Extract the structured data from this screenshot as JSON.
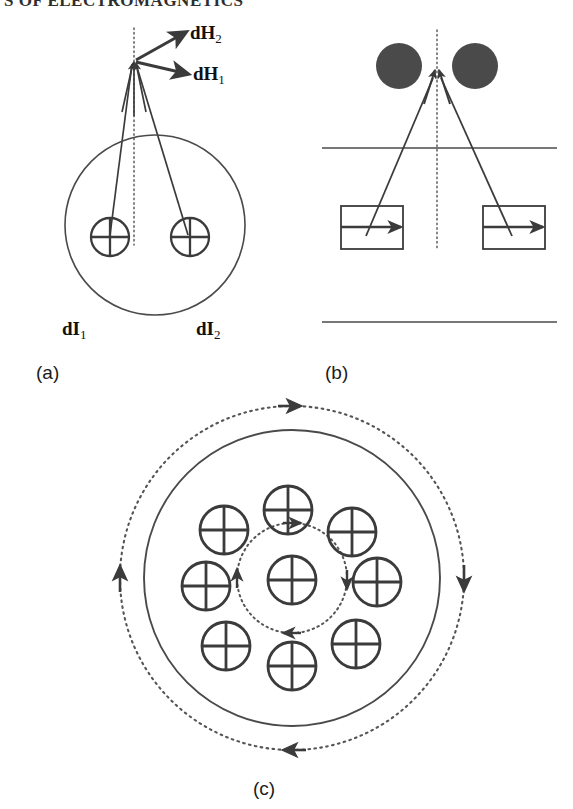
{
  "header": {
    "text": "S OF ELECTROMAGNETICS",
    "clipped": true
  },
  "colors": {
    "stroke": "#3b3b3b",
    "dotted": "#555555",
    "fill_circle": "#4a4a4a",
    "text": "#1a1a1a",
    "background": "#ffffff"
  },
  "panels": [
    {
      "id": "a",
      "caption": "(a)",
      "description": "Two current elements inside a circular conductor cross-section with resultant field vectors at an external point",
      "labels": [
        {
          "name": "field-vector-2",
          "main": "dH",
          "sub": "2"
        },
        {
          "name": "field-vector-1",
          "main": "dH",
          "sub": "1"
        },
        {
          "name": "current-element-1",
          "main": "dI",
          "sub": "1"
        },
        {
          "name": "current-element-2",
          "main": "dI",
          "sub": "2"
        }
      ],
      "symbols": {
        "current_into_page_count": 2,
        "glyph": "oplus"
      },
      "outer_circle": {
        "cx": 155,
        "cy": 225,
        "r": 90
      }
    },
    {
      "id": "b",
      "caption": "(b)",
      "description": "Two filled circles above a boundary line with two rectangular current elements containing rightward arrows",
      "filled_circles": 2,
      "rectangles": 2,
      "rect_arrow_direction": "right",
      "horizontal_lines": 2
    },
    {
      "id": "c",
      "caption": "(c)",
      "description": "Nine current elements into the page inside a solid circle, with inner and outer dotted field loops carrying arrowheads",
      "symbols": {
        "current_into_page_count": 9,
        "glyph": "oplus",
        "grid": "3x3"
      },
      "loops": [
        {
          "name": "inner-dotted-loop",
          "r": 55,
          "arrowheads": 4,
          "direction": "clockwise"
        },
        {
          "name": "outer-dotted-loop",
          "r": 172,
          "arrowheads": 4,
          "direction": "clockwise"
        }
      ],
      "solid_circle": {
        "cx": 292,
        "cy": 578,
        "r": 148
      }
    }
  ]
}
